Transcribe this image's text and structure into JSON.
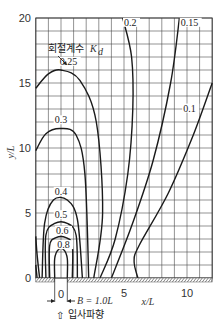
{
  "chart_data": {
    "type": "line",
    "title": "",
    "xlabel": "x/L",
    "ylabel": "y/L",
    "xlim": [
      -2,
      12
    ],
    "ylim": [
      0,
      20
    ],
    "grid": true,
    "x_ticks": [
      "0",
      "5",
      "10"
    ],
    "y_ticks": [
      "0",
      "5",
      "10",
      "15",
      "20"
    ],
    "legend_title": "회절계수 K_d",
    "annotations": {
      "coefficient_label": "회절계수",
      "coefficient_symbol": "K",
      "coefficient_subscript": "d",
      "gap_width": "B = 1.0L",
      "incident_wave": "입사파향",
      "incident_arrow": "⇧",
      "gap_zero": "0"
    },
    "series": [
      {
        "name": "0.8",
        "points": [
          [
            -0.5,
            0
          ],
          [
            -0.5,
            1.5
          ],
          [
            -0.2,
            2.2
          ],
          [
            0.2,
            2.2
          ],
          [
            0.5,
            1.5
          ],
          [
            0.5,
            0
          ]
        ]
      },
      {
        "name": "0.6",
        "points": [
          [
            -0.9,
            0
          ],
          [
            -0.9,
            2.5
          ],
          [
            -0.4,
            3.1
          ],
          [
            0.4,
            3.1
          ],
          [
            0.9,
            2.5
          ],
          [
            0.9,
            0
          ]
        ]
      },
      {
        "name": "0.5",
        "points": [
          [
            -1.2,
            0
          ],
          [
            -1.2,
            3.3
          ],
          [
            -0.5,
            4.2
          ],
          [
            0.5,
            4.2
          ],
          [
            1.2,
            3.3
          ],
          [
            1.3,
            0
          ]
        ]
      },
      {
        "name": "0.4",
        "points": [
          [
            -1.5,
            0
          ],
          [
            -1.3,
            4.2
          ],
          [
            -0.6,
            6.0
          ],
          [
            0.5,
            6.0
          ],
          [
            1.3,
            4.5
          ],
          [
            1.7,
            0
          ]
        ]
      },
      {
        "name": "0.3",
        "points": [
          [
            -2,
            9.8
          ],
          [
            -1.2,
            11.1
          ],
          [
            0,
            11.5
          ],
          [
            1.2,
            11.0
          ],
          [
            1.9,
            8.0
          ],
          [
            2.2,
            0
          ]
        ]
      },
      {
        "name": "0.25",
        "points": [
          [
            -2,
            14.6
          ],
          [
            -1,
            15.7
          ],
          [
            0,
            16.0
          ],
          [
            1.5,
            15.2
          ],
          [
            2.8,
            12.0
          ],
          [
            3.3,
            5.0
          ],
          [
            2.6,
            0
          ]
        ]
      },
      {
        "name": "0.2",
        "points": [
          [
            4.9,
            20
          ],
          [
            5.6,
            17
          ],
          [
            5.7,
            13
          ],
          [
            5.3,
            8
          ],
          [
            4.3,
            3
          ],
          [
            3.1,
            0
          ]
        ]
      },
      {
        "name": "0.15",
        "points": [
          [
            9.4,
            20
          ],
          [
            8.7,
            15
          ],
          [
            7.3,
            9
          ],
          [
            5.6,
            4
          ],
          [
            4.0,
            0
          ]
        ]
      },
      {
        "name": "0.1",
        "points": [
          [
            12,
            15.0
          ],
          [
            10.5,
            11
          ],
          [
            8.5,
            6.5
          ],
          [
            6.2,
            2.5
          ],
          [
            5.8,
            1.3
          ],
          [
            6.1,
            0
          ]
        ]
      }
    ],
    "colors": {
      "line": "#1a1a1a",
      "grid": "#4a4a4a",
      "frame": "#333333",
      "hatch": "#555555"
    }
  }
}
